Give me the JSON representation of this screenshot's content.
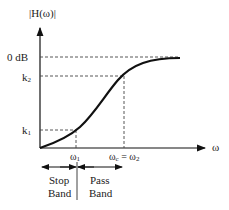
{
  "diagram": {
    "y_axis_label": "|H(ω)|",
    "x_axis_label": "ω",
    "y_ticks": [
      {
        "label": "0 dB"
      },
      {
        "label": "k2"
      },
      {
        "label": "k1"
      }
    ],
    "x_ticks": [
      {
        "label": "ω1"
      },
      {
        "label": "ωc = ω2"
      }
    ],
    "bands": {
      "stop": {
        "line1": "Stop",
        "line2": "Band"
      },
      "pass": {
        "line1": "Pass",
        "line2": "Band"
      }
    },
    "curve_color": "#111111",
    "dash_color": "#444444"
  }
}
